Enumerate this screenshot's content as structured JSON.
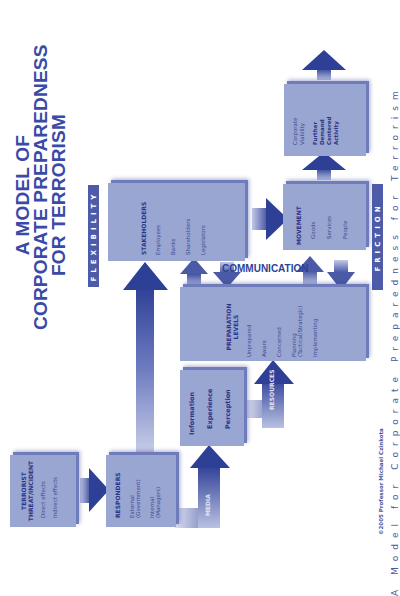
{
  "title": {
    "line1": "A MODEL OF",
    "line2": "CORPORATE PREPAREDNESS",
    "line3": "FOR TERRORISM"
  },
  "bands": {
    "flexibility": "FLEXIBILITY",
    "friction": "FRICTION",
    "communication": "COMMUNICATION"
  },
  "boxes": {
    "terrorist": {
      "heading_line1": "TERRORIST",
      "heading_line2": "THREAT/INCIDENT",
      "items": [
        "Direct effects",
        "Indirect effects"
      ]
    },
    "responders": {
      "heading": "RESPONDERS",
      "items": [
        "External (Government)",
        "Internal (Managers)"
      ]
    },
    "info": {
      "items": [
        "Information",
        "Experience",
        "Perception"
      ]
    },
    "preparation": {
      "heading_line1": "PREPARATION",
      "heading_line2": "LEVELS",
      "items": [
        "Unprepared",
        "Aware",
        "Concerned",
        "Planning (Tactical/Strategic)",
        "Implementing"
      ]
    },
    "stakeholders": {
      "heading": "STAKEHOLDERS",
      "items": [
        "Employees",
        "Banks",
        "Shareholders",
        "Legislators"
      ]
    },
    "movement": {
      "heading": "MOVEMENT",
      "items": [
        "Goods",
        "Services",
        "People"
      ]
    },
    "outcome": {
      "items": [
        "Corporate Viability",
        "Further Demand Centered Activity"
      ]
    }
  },
  "arrow_labels": {
    "media": "MEDIA",
    "resources": "RESOURCES"
  },
  "copyright": "©2005 Professor Michael Czinkota",
  "caption_fragment": "A Model for Corporate Preparedness for Terrorism",
  "colors": {
    "box": "#9aa6d2",
    "box_shadow": "#6f7cbc",
    "arrow_dark": "#2e3f96",
    "title": "#3a4aa8",
    "band": "#4d5ba8"
  }
}
